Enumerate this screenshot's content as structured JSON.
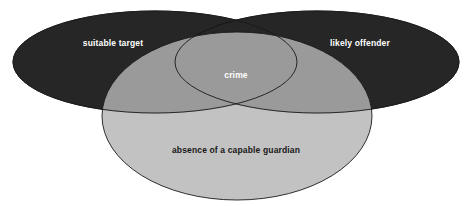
{
  "diagram": {
    "type": "venn",
    "background_color": "#ffffff",
    "sets": [
      {
        "id": "suitable-target",
        "label": "suitable target",
        "fill_color": "#262626",
        "label_color": "#ffffff",
        "position": "upper-left",
        "cx": 155,
        "cy": 62,
        "rx": 142,
        "ry": 51
      },
      {
        "id": "likely-offender",
        "label": "likely offender",
        "fill_color": "#262626",
        "label_color": "#ffffff",
        "position": "upper-right",
        "cx": 317,
        "cy": 62,
        "rx": 142,
        "ry": 51
      },
      {
        "id": "absence-of-capable-guardian",
        "label": "absence of a capable guardian",
        "fill_color": "#b4b4b4",
        "label_color": "#171717",
        "position": "bottom-center",
        "cx": 237,
        "cy": 116,
        "rx": 135,
        "ry": 84
      }
    ],
    "intersections": [
      {
        "id": "crime",
        "label": "crime",
        "label_color": "#ffffff",
        "of": [
          "suitable-target",
          "likely-offender",
          "absence-of-capable-guardian"
        ],
        "cx": 236,
        "cy": 76
      }
    ],
    "label_positions": {
      "suitable_target": {
        "x": 113,
        "y": 44
      },
      "likely_offender": {
        "x": 360,
        "y": 44
      },
      "crime": {
        "x": 236,
        "y": 76
      },
      "absence_of_a_capable_guardian": {
        "x": 236,
        "y": 151
      }
    },
    "colors": {
      "dark_set": "#262626",
      "gray_set": "#b4b4b4",
      "gray_over_dark": "#5a5a5a",
      "outline": "#1a1a1a",
      "background": "#ffffff",
      "light_text": "#ffffff",
      "dark_text": "#171717"
    }
  }
}
